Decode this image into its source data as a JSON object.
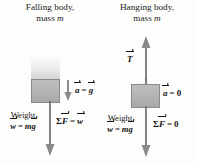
{
  "diagram": {
    "type": "physics-free-body-diagram",
    "background_color": "#fdfdfc",
    "ink_color": "#141414",
    "block_color": "#b3b3b3"
  },
  "panels": [
    {
      "id": "falling-body",
      "title_line1": "Falling body,",
      "title_line2_prefix": "mass ",
      "title_line2_symbol": "m",
      "block_label": "",
      "motion_trail": "falling-blur-trail",
      "acceleration": {
        "symbol": "a",
        "equals": "=",
        "value_symbol": "g",
        "value_is_vector": true,
        "arrow_direction": "down",
        "caption": "a = g"
      },
      "weight": {
        "caption": "Weight",
        "symbol": "w",
        "equals": "=",
        "expression_mass": "m",
        "expression_g": "g",
        "caption_full": "w = mg",
        "arrow_direction": "down"
      },
      "net_force": {
        "sigma": "Σ",
        "symbol": "F",
        "equals": "=",
        "value_symbol": "w",
        "value_is_vector": true,
        "caption": "ΣF = w"
      }
    },
    {
      "id": "hanging-body",
      "title_line1": "Hanging body,",
      "title_line2_prefix": "mass ",
      "title_line2_symbol": "m",
      "tension": {
        "symbol": "T",
        "arrow_direction": "up",
        "caption": "T"
      },
      "acceleration": {
        "symbol": "a",
        "equals": "=",
        "value_symbol": "0",
        "value_is_vector": false,
        "caption": "a = 0"
      },
      "weight": {
        "caption": "Weight",
        "symbol": "w",
        "equals": "=",
        "expression_mass": "m",
        "expression_g": "g",
        "caption_full": "w = mg",
        "arrow_direction": "down"
      },
      "net_force": {
        "sigma": "Σ",
        "symbol": "F",
        "equals": "=",
        "value_symbol": "0",
        "value_is_vector": false,
        "caption": "ΣF = 0"
      }
    }
  ]
}
